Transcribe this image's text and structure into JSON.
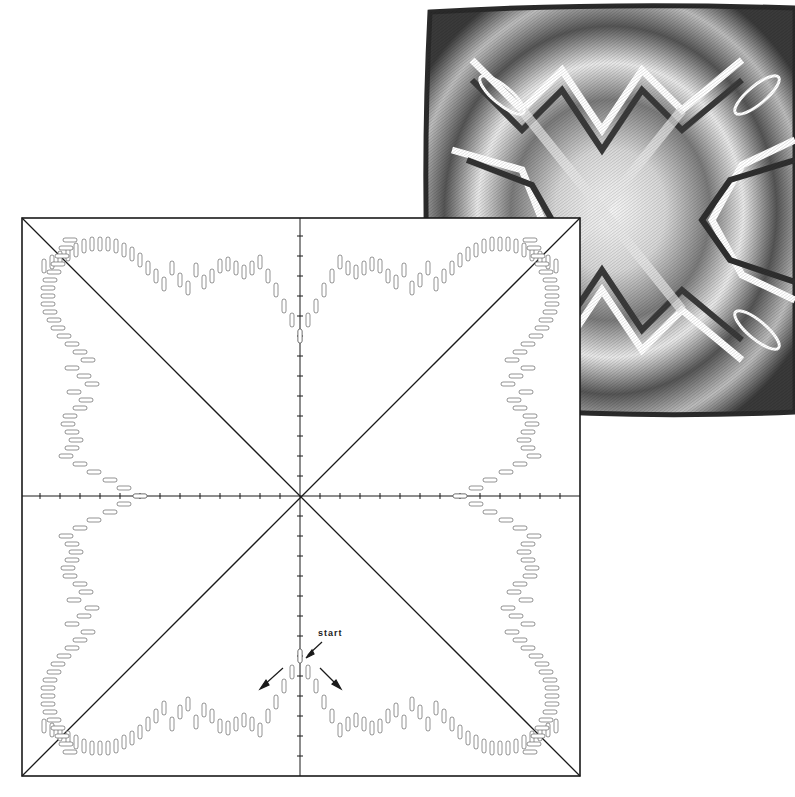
{
  "figure": {
    "type": "bargello-chart",
    "annotation": {
      "label": "start"
    },
    "colors": {
      "frame": "#1a1a1a",
      "stitch_outline": "#555555",
      "background": "#ffffff"
    }
  },
  "diagram": {
    "frame": {
      "left": 22,
      "top": 218,
      "right": 580,
      "bottom": 776
    },
    "center": {
      "x": 300,
      "y": 496
    },
    "tick_spacing": 20,
    "diagonals": 2,
    "axes": 2
  },
  "photo": {
    "subject": "finished Bargello pillow",
    "tones": [
      "#f2f2f2",
      "#c8c8c8",
      "#8a8a8a",
      "#4a4a4a",
      "#1e1e1e"
    ]
  }
}
